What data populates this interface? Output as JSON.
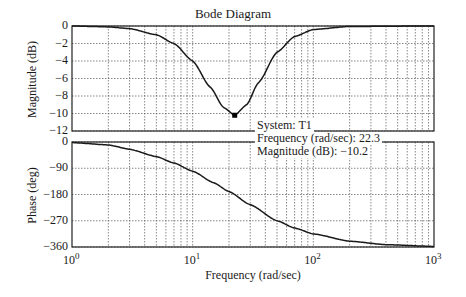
{
  "chart_data": [
    {
      "type": "line",
      "title": "Bode Diagram",
      "panel": "magnitude",
      "xlabel": "Frequency (rad/sec)",
      "ylabel": "Magnitude (dB)",
      "xscale": "log",
      "xlim": [
        1,
        1000
      ],
      "ylim": [
        -12,
        0
      ],
      "yticks": [
        0,
        -2,
        -4,
        -6,
        -8,
        -10,
        -12
      ],
      "grid": true,
      "series": [
        {
          "name": "T1",
          "x": [
            1,
            2,
            3,
            5,
            7,
            10,
            14,
            18,
            22.3,
            28,
            35,
            50,
            70,
            100,
            200,
            1000
          ],
          "y": [
            0,
            -0.1,
            -0.3,
            -1.0,
            -2.0,
            -4.0,
            -7.0,
            -9.3,
            -10.2,
            -9.0,
            -6.5,
            -3.0,
            -1.2,
            -0.4,
            -0.05,
            0
          ]
        }
      ],
      "annotation": {
        "system": "System: T1",
        "frequency": "Frequency (rad/sec): 22.3",
        "magnitude": "Magnitude (dB):  −10.2",
        "marker_x": 22.3,
        "marker_y": -10.2
      }
    },
    {
      "type": "line",
      "panel": "phase",
      "xlabel": "Frequency (rad/sec)",
      "ylabel": "Phase (deg)",
      "xscale": "log",
      "xlim": [
        1,
        1000
      ],
      "ylim": [
        -360,
        0
      ],
      "yticks": [
        0,
        -90,
        -180,
        -270,
        -360
      ],
      "xticks": [
        "10^0",
        "10^1",
        "10^2",
        "10^3"
      ],
      "grid": true,
      "series": [
        {
          "name": "T1",
          "x": [
            1,
            2,
            3,
            5,
            7,
            10,
            15,
            20,
            30,
            50,
            70,
            100,
            200,
            400,
            1000
          ],
          "y": [
            -2,
            -10,
            -25,
            -50,
            -72,
            -100,
            -140,
            -170,
            -215,
            -270,
            -295,
            -315,
            -340,
            -352,
            -358
          ]
        }
      ]
    }
  ],
  "labels": {
    "title": "Bode Diagram",
    "mag_ylabel": "Magnitude (dB)",
    "phase_ylabel": "Phase (deg)",
    "xlabel": "Frequency (rad/sec)",
    "mag_ticks": [
      "0",
      "−2",
      "−4",
      "−6",
      "−8",
      "−10",
      "−12"
    ],
    "phase_ticks": [
      "0",
      "−90",
      "−180",
      "−270",
      "−360"
    ],
    "x_base": [
      "10",
      "10",
      "10",
      "10"
    ],
    "x_exp": [
      "0",
      "1",
      "2",
      "3"
    ],
    "annot_system": "System: T1",
    "annot_freq": "Frequency (rad/sec): 22.3",
    "annot_mag": "Magnitude (dB):  −10.2"
  }
}
